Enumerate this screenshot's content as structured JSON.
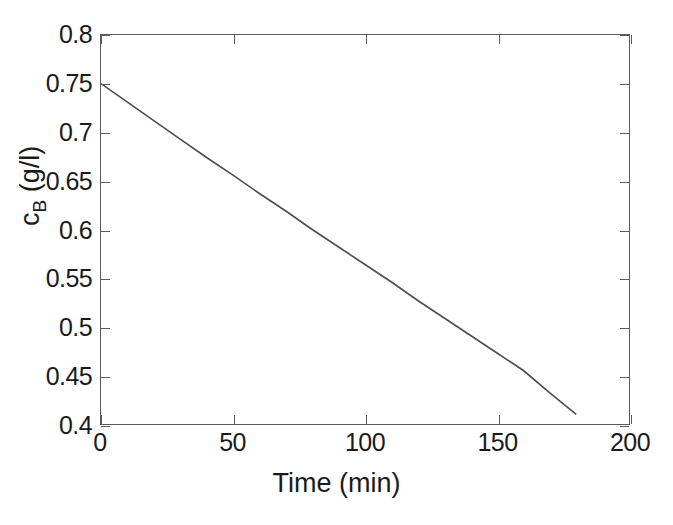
{
  "chart_data": {
    "type": "line",
    "title": "",
    "xlabel": "Time (min)",
    "ylabel": "c_B (g/l)",
    "ylabel_base": "c",
    "ylabel_sub": "B",
    "ylabel_units": " (g/l)",
    "xlim": [
      0,
      200
    ],
    "ylim": [
      0.4,
      0.8
    ],
    "xticks": [
      0,
      50,
      100,
      150,
      200
    ],
    "xticklabels": [
      "0",
      "50",
      "100",
      "150",
      "200"
    ],
    "yticks": [
      0.4,
      0.45,
      0.5,
      0.55,
      0.6,
      0.65,
      0.7,
      0.75,
      0.8
    ],
    "yticklabels": [
      "0.4",
      "0.45",
      "0.5",
      "0.55",
      "0.6",
      "0.65",
      "0.7",
      "0.75",
      "0.8"
    ],
    "grid": false,
    "legend": null,
    "line_color": "#4d4d4d",
    "axis_color": "#5b5b5b",
    "series": [
      {
        "name": "c_B",
        "x": [
          0,
          10,
          20,
          30,
          40,
          50,
          60,
          70,
          80,
          90,
          100,
          110,
          120,
          130,
          140,
          150,
          160,
          170,
          180
        ],
        "y": [
          0.75,
          0.731,
          0.712,
          0.693,
          0.674,
          0.656,
          0.637,
          0.619,
          0.6,
          0.582,
          0.564,
          0.546,
          0.527,
          0.509,
          0.491,
          0.473,
          0.455,
          0.432,
          0.41
        ]
      }
    ]
  }
}
